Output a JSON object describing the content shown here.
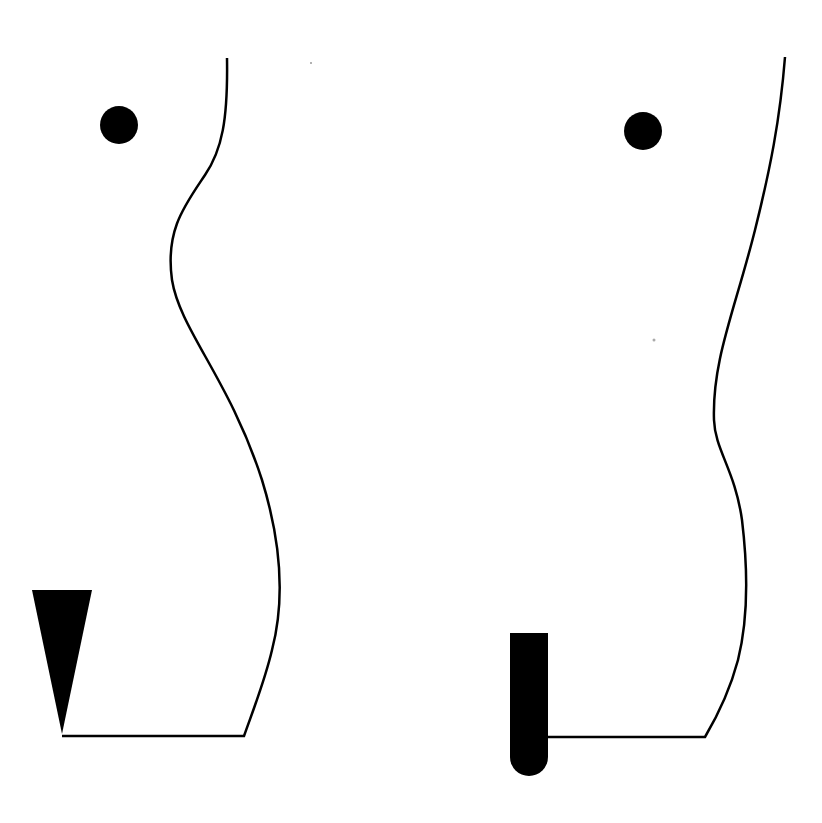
{
  "figures": [
    {
      "name": "left-silhouette",
      "marker": "triangle",
      "dot": {
        "cx": 119,
        "cy": 125,
        "r": 19
      }
    },
    {
      "name": "right-silhouette",
      "marker": "rounded-bar",
      "dot": {
        "cx": 643,
        "cy": 131,
        "r": 19
      }
    }
  ],
  "colors": {
    "stroke": "#000000",
    "fill": "#000000",
    "background": "#ffffff"
  }
}
